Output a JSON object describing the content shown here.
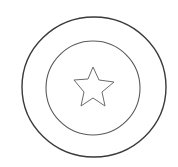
{
  "drawing": {
    "subject": "shield-with-star",
    "stroke_color": "#444444",
    "background": "#ffffff",
    "outer_circle": {
      "cx": 94,
      "cy": 87,
      "rx": 72,
      "ry": 70
    },
    "inner_circle": {
      "cx": 93,
      "cy": 88,
      "rx": 47,
      "ry": 47
    },
    "star": {
      "points": "93,67 99,80 114,82 102,92 105,106 93,98 81,106 84,92 74,80 88,79"
    }
  }
}
